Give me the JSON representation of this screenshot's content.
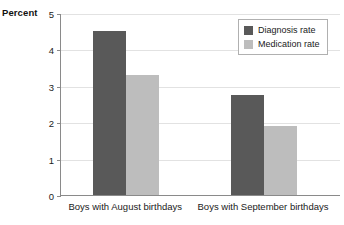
{
  "chart_data": {
    "type": "bar",
    "title": "",
    "subtitle": "",
    "xlabel": "",
    "ylabel": "Percent",
    "ylim": [
      0,
      5
    ],
    "yticks": [
      0,
      1,
      2,
      3,
      4,
      5
    ],
    "ytick_labels": [
      "0",
      "1",
      "2",
      "3",
      "4",
      "5"
    ],
    "grid": true,
    "legend_position": "upper right inside",
    "categories": [
      "Boys with August birthdays",
      "Boys with September birthdays"
    ],
    "series": [
      {
        "name": "Diagnosis rate",
        "color": "#595959",
        "values": [
          4.5,
          2.75
        ]
      },
      {
        "name": "Medication rate",
        "color": "#bdbdbd",
        "values": [
          3.3,
          1.9
        ]
      }
    ]
  },
  "colors": {
    "diagnosis": "#595959",
    "medication": "#bdbdbd",
    "axis": "#8a8a8a",
    "gridline": "#e2e2e2",
    "legend_border": "#b0b0b0",
    "background": "#ffffff"
  }
}
